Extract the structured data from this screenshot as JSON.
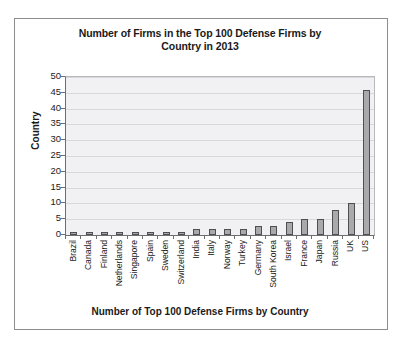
{
  "figure": {
    "title": "Number of Firms in the Top 100 Defense Firms by Country in 2013",
    "title_line1": "Number of Firms in the Top 100 Defense Firms by",
    "title_line2": "Country in 2013",
    "xlabel": "Number of Top 100 Defense Firms by Country",
    "ylabel": "Country",
    "plot_bg_color": "#f1f1f3",
    "bar_fill_color": "#a9a9ad",
    "bar_edge_color": "#4f4f52",
    "gridline_color": "#d8d8dc",
    "frame_color": "#8d8d8d"
  },
  "chart_data": {
    "type": "bar",
    "title": "Number of Firms in the Top 100 Defense Firms by Country in 2013",
    "xlabel": "Number of Top 100 Defense Firms by Country",
    "ylabel": "Country",
    "orientation": "vertical",
    "categories": [
      "Brazil",
      "Canada",
      "Finland",
      "Netherlands",
      "Singapore",
      "Spain",
      "Sweden",
      "Switzerland",
      "India",
      "Italy",
      "Norway",
      "Turkey",
      "Germany",
      "South Korea",
      "Israel",
      "France",
      "Japan",
      "Russia",
      "UK",
      "US"
    ],
    "values": [
      1,
      1,
      1,
      1,
      1,
      1,
      1,
      1,
      2,
      2,
      2,
      2,
      3,
      3,
      4,
      5,
      5,
      8,
      10,
      46
    ],
    "ylim": [
      0,
      50
    ],
    "yticks": [
      0,
      5,
      10,
      15,
      20,
      25,
      30,
      35,
      40,
      45,
      50
    ],
    "ytick_labels": [
      "0",
      "5",
      "10",
      "15",
      "20",
      "25",
      "30",
      "35",
      "40",
      "45",
      "50"
    ],
    "grid": "horizontal",
    "legend": null
  }
}
